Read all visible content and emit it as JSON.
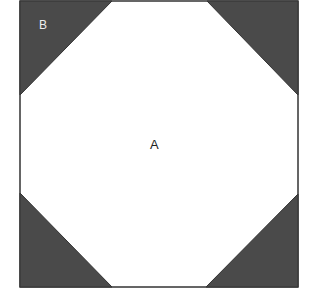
{
  "diagram": {
    "type": "square-with-corner-triangles",
    "square": {
      "x": 20,
      "y": 1,
      "width": 278,
      "height": 286
    },
    "colors": {
      "fill_region_a": "#ffffff",
      "fill_region_b": "#4a4a4a",
      "outline": "#333333"
    },
    "regions": {
      "A": {
        "label": "A",
        "description": "central octagon region"
      },
      "B": {
        "label": "B",
        "description": "shaded corner triangles"
      }
    },
    "triangles": [
      {
        "corner": "top-left",
        "points": [
          [
            20,
            1
          ],
          [
            112,
            1
          ],
          [
            20,
            95
          ]
        ]
      },
      {
        "corner": "top-right",
        "points": [
          [
            207,
            1
          ],
          [
            298,
            1
          ],
          [
            298,
            95
          ]
        ]
      },
      {
        "corner": "bottom-left",
        "points": [
          [
            20,
            193
          ],
          [
            20,
            287
          ],
          [
            112,
            287
          ]
        ]
      },
      {
        "corner": "bottom-right",
        "points": [
          [
            206,
            287
          ],
          [
            298,
            287
          ],
          [
            298,
            194
          ]
        ]
      }
    ]
  },
  "labels": {
    "a": "A",
    "b": "B"
  },
  "caption": {
    "text": "— — —"
  }
}
